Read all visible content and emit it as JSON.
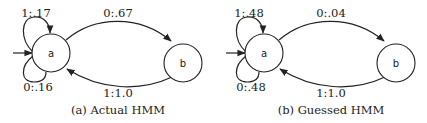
{
  "panels": [
    {
      "caption": "(a) Actual HMM",
      "states": [
        {
          "id": "a",
          "label": "a",
          "initial": true
        },
        {
          "id": "b",
          "label": "b",
          "initial": false
        }
      ],
      "transitions": [
        {
          "from": "a",
          "to": "a",
          "label": "1:.17",
          "symbol": "1",
          "prob": 0.17
        },
        {
          "from": "a",
          "to": "a",
          "label": "0:.16",
          "symbol": "0",
          "prob": 0.16
        },
        {
          "from": "a",
          "to": "b",
          "label": "0:.67",
          "symbol": "0",
          "prob": 0.67
        },
        {
          "from": "b",
          "to": "a",
          "label": "1:1.0",
          "symbol": "1",
          "prob": 1.0
        }
      ]
    },
    {
      "caption": "(b) Guessed HMM",
      "states": [
        {
          "id": "a",
          "label": "a",
          "initial": true
        },
        {
          "id": "b",
          "label": "b",
          "initial": false
        }
      ],
      "transitions": [
        {
          "from": "a",
          "to": "a",
          "label": "1:.48",
          "symbol": "1",
          "prob": 0.48
        },
        {
          "from": "a",
          "to": "a",
          "label": "0:.48",
          "symbol": "0",
          "prob": 0.48
        },
        {
          "from": "a",
          "to": "b",
          "label": "0:.04",
          "symbol": "0",
          "prob": 0.04
        },
        {
          "from": "b",
          "to": "a",
          "label": "1:1.0",
          "symbol": "1",
          "prob": 1.0
        }
      ]
    }
  ]
}
